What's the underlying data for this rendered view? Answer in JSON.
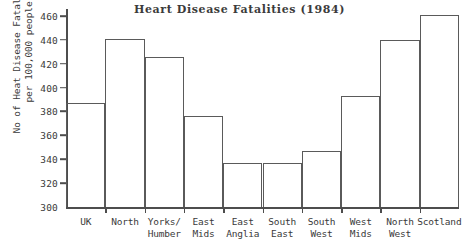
{
  "chart_data": {
    "type": "bar",
    "title": "Heart Disease Fatalities (1984)",
    "xlabel": "",
    "ylabel": "No of Heat Disease Fatalities per 100,000 people",
    "ylabel_lines": [
      "No of Heat Disease Fatalities",
      "per 100,000 people"
    ],
    "ylim": [
      300,
      465
    ],
    "yticks": [
      300,
      320,
      340,
      360,
      380,
      400,
      420,
      440,
      460
    ],
    "ytick_labels": [
      "300",
      "320",
      "340",
      "360",
      "380",
      "400",
      "420",
      "440",
      "460"
    ],
    "grid": false,
    "legend": "none",
    "categories": [
      "UK",
      "North",
      "Yorks/ Humber",
      "East Mids",
      "East Anglia",
      "South East",
      "South West",
      "West Mids",
      "North West",
      "Scotland"
    ],
    "category_lines": [
      [
        "UK",
        ""
      ],
      [
        "North",
        ""
      ],
      [
        "Yorks/",
        "Humber"
      ],
      [
        "East",
        "Mids"
      ],
      [
        "East",
        "Anglia"
      ],
      [
        "South",
        "East"
      ],
      [
        "South",
        "West"
      ],
      [
        "West",
        "Mids"
      ],
      [
        "North",
        "West"
      ],
      [
        "Scotland",
        ""
      ]
    ],
    "values": [
      387,
      441,
      426,
      376,
      337,
      337,
      347,
      393,
      440,
      461
    ],
    "bar_outline_color": "#5a5a5a",
    "bar_fill_color": "transparent",
    "axis_color": "#4d4d4d",
    "text_color": "#3a3a3a",
    "background_color": "#ffffff"
  }
}
